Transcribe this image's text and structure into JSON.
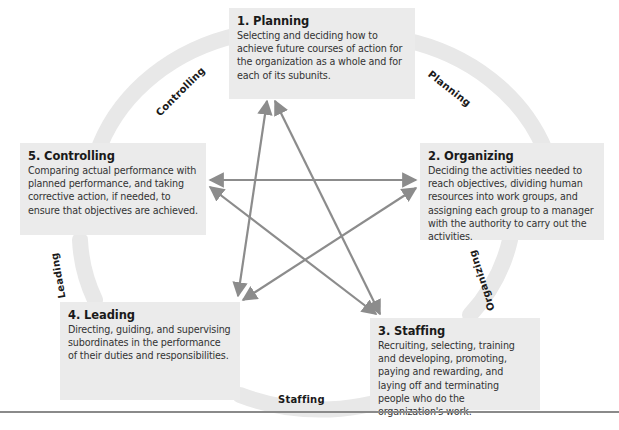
{
  "functions": [
    {
      "id": "planning",
      "title": "1. Planning",
      "description": "Selecting and deciding how to achieve future courses of action for the organization as a whole and for each of its subunits."
    },
    {
      "id": "organizing",
      "title": "2. Organizing",
      "description": "Deciding the activities needed to reach objectives, dividing human resources into work groups, and assigning each group to a manager with the authority to carry out the activities."
    },
    {
      "id": "staffing",
      "title": "3. Staffing",
      "description": "Recruiting, selecting, training and developing, promoting, paying and rewarding, and laying off and terminating people who do the organization's work."
    },
    {
      "id": "leading",
      "title": "4. Leading",
      "description": "Directing, guiding, and supervising subordinates in the performance of their duties and responsibilities."
    },
    {
      "id": "controlling",
      "title": "5. Controlling",
      "description": "Comparing actual performance with planned performance, and taking corrective action, if needed, to ensure that objectives are achieved."
    }
  ],
  "cycle_labels": {
    "planning": "Planning",
    "organizing": "Organizing",
    "staffing": "Staffing",
    "leading": "Leading",
    "controlling": "Controlling"
  },
  "colors": {
    "box_fill": "#ebebeb",
    "cycle_band": "#e6e6e6",
    "arrow": "#8c8c8c",
    "title_text": "#1a1a1a",
    "body_text": "#333333",
    "rule": "#8a8a8a"
  }
}
